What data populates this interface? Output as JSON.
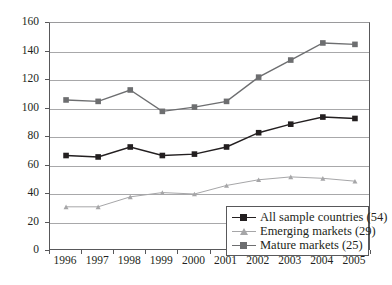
{
  "chart_data": {
    "type": "line",
    "title": "",
    "subtitle": "",
    "xlabel": "",
    "ylabel": "",
    "x": [
      "1996",
      "1997",
      "1998",
      "1999",
      "2000",
      "2001",
      "2002",
      "2003",
      "2004",
      "2005"
    ],
    "categories": [
      "1996",
      "1997",
      "1998",
      "1999",
      "2000",
      "2001",
      "2002",
      "2003",
      "2004",
      "2005"
    ],
    "ylim": [
      0,
      160
    ],
    "yticks": [
      0,
      20,
      40,
      60,
      80,
      100,
      120,
      140,
      160
    ],
    "ytick_labels": [
      "0",
      "20",
      "40",
      "60",
      "80",
      "100",
      "120",
      "140",
      "160"
    ],
    "grid": true,
    "legend_position": "bottom-right",
    "series": [
      {
        "name": "All sample countries (54)",
        "marker": "square",
        "color": "#231f20",
        "values": [
          67,
          66,
          73,
          67,
          68,
          73,
          83,
          89,
          94,
          93
        ]
      },
      {
        "name": "Emerging markets (29)",
        "marker": "triangle",
        "color": "#a6a6a8",
        "values": [
          31,
          31,
          38,
          41,
          40,
          46,
          50,
          52,
          51,
          49
        ]
      },
      {
        "name": "Mature markets (25)",
        "marker": "square",
        "color": "#6d6e70",
        "values": [
          106,
          105,
          113,
          98,
          101,
          105,
          122,
          134,
          146,
          145
        ]
      }
    ]
  },
  "legend": {
    "entries": [
      {
        "label": "All sample countries (54)",
        "color": "#231f20",
        "marker": "square"
      },
      {
        "label": "Emerging markets (29)",
        "color": "#a6a6a8",
        "marker": "triangle"
      },
      {
        "label": "Mature markets (25)",
        "color": "#6d6e70",
        "marker": "square"
      }
    ]
  },
  "colors": {
    "all_sample": "#231f20",
    "emerging": "#a6a6a8",
    "mature": "#6d6e70",
    "grid": "#a8a8aa",
    "axis": "#58585a",
    "background": "#ffffff"
  }
}
